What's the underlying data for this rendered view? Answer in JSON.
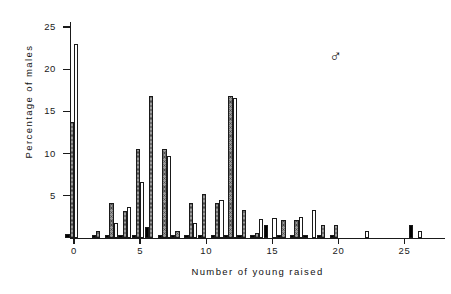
{
  "chart_data": {
    "type": "bar",
    "title": "",
    "subtitle": "",
    "xlabel": "Number of young raised",
    "ylabel": "Percentage of males",
    "annotation": "♂",
    "annotation_name": "male-symbol",
    "xlim": [
      -0.7,
      27.5
    ],
    "ylim": [
      0,
      26.5
    ],
    "xticks": [
      0,
      5,
      10,
      15,
      20,
      25
    ],
    "xtick_labels": [
      "0",
      "5",
      "10",
      "15",
      "20",
      "25"
    ],
    "yticks": [
      5,
      10,
      15,
      20,
      25
    ],
    "ytick_labels": [
      "5",
      "10",
      "15",
      "20",
      "25"
    ],
    "grid": false,
    "legend": "none",
    "bar_styles": {
      "hatched": "#9a9a9a",
      "white": "#ffffff",
      "black": "#000000",
      "outline": "#1a1a1a"
    },
    "categories": [
      0,
      1,
      2,
      3,
      4,
      5,
      6,
      7,
      8,
      9,
      10,
      11,
      12,
      13,
      14,
      15,
      16,
      17,
      18,
      19,
      20,
      21,
      22,
      23,
      24,
      25,
      26
    ],
    "series": [
      {
        "name": "hatched",
        "style": "hatch",
        "values": [
          13.8,
          0,
          0.8,
          4.2,
          3.2,
          10.5,
          16.8,
          10.6,
          0.8,
          4.2,
          5.2,
          4.2,
          16.8,
          3.3,
          0.6,
          0,
          2.1,
          2.1,
          0,
          1.6,
          1.6,
          0,
          0,
          0,
          0,
          0,
          0
        ]
      },
      {
        "name": "white",
        "style": "white",
        "values": [
          23.0,
          0,
          0,
          1.8,
          3.7,
          6.6,
          0,
          9.7,
          0,
          1.8,
          0,
          4.5,
          16.6,
          0,
          2.3,
          2.4,
          0,
          2.5,
          3.3,
          0,
          0,
          0,
          0.8,
          0,
          0,
          0,
          0.8
        ]
      },
      {
        "name": "black",
        "style": "black",
        "values": [
          0.5,
          0,
          0.4,
          0.4,
          0.4,
          0.4,
          1.3,
          0.4,
          0.4,
          0.4,
          0.4,
          0.4,
          0.4,
          0.4,
          0.4,
          1.5,
          0.4,
          0.4,
          0.4,
          0.4,
          0.4,
          0,
          0,
          0,
          0,
          0,
          1.6
        ]
      }
    ]
  }
}
